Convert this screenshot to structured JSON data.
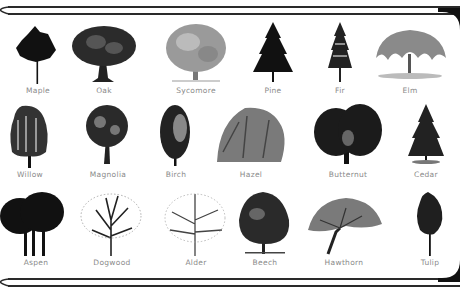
{
  "frame": {
    "line_color": "#2a2a2a",
    "corner_color": "#111111",
    "background": "#ffffff",
    "label_color": "#8a8a8a"
  },
  "rows": [
    {
      "trees": [
        {
          "name": "Maple",
          "style": "dark-round"
        },
        {
          "name": "Oak",
          "style": "wide-round"
        },
        {
          "name": "Sycomore",
          "style": "light-broad"
        },
        {
          "name": "Pine",
          "style": "conifer-dark"
        },
        {
          "name": "Fir",
          "style": "conifer-narrow"
        },
        {
          "name": "Elm",
          "style": "weeping-wide"
        }
      ]
    },
    {
      "trees": [
        {
          "name": "Willow",
          "style": "weeping"
        },
        {
          "name": "Magnolia",
          "style": "round-lollipop"
        },
        {
          "name": "Birch",
          "style": "columnar"
        },
        {
          "name": "Hazel",
          "style": "bushy-light"
        },
        {
          "name": "Butternut",
          "style": "dark-broad"
        },
        {
          "name": "Cedar",
          "style": "conifer-dark"
        }
      ]
    },
    {
      "trees": [
        {
          "name": "Aspen",
          "style": "grove-dark"
        },
        {
          "name": "Dogwood",
          "style": "sparse-branching"
        },
        {
          "name": "Alder",
          "style": "sparse-light"
        },
        {
          "name": "Beech",
          "style": "dome-dark"
        },
        {
          "name": "Hawthorn",
          "style": "spreading"
        },
        {
          "name": "Tulip",
          "style": "narrow-tall"
        }
      ]
    }
  ]
}
